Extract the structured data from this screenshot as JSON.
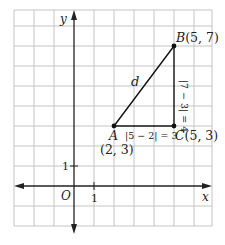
{
  "diagram": {
    "type": "coordinate-plane-distance",
    "grid": {
      "x_min": -3,
      "x_max": 6.9,
      "y_min": -2,
      "y_max": 8.8,
      "unit_px": 20,
      "origin_px": [
        74,
        186
      ],
      "left_px": 14,
      "right_px": 212,
      "top_px": 10,
      "bottom_px": 226,
      "grid_color": "#b5b5b5",
      "axis_color": "#222222"
    },
    "axes": {
      "x_label": "x",
      "y_label": "y",
      "origin_label": "O",
      "x_tick_label": "1",
      "y_tick_label": "1"
    },
    "points": [
      {
        "id": "A",
        "name": "A",
        "coords": "(2, 3)",
        "x": 2,
        "y": 3
      },
      {
        "id": "B",
        "name": "B",
        "coords": "(5, 7)",
        "x": 5,
        "y": 7
      },
      {
        "id": "C",
        "name": "C",
        "coords": "(5, 3)",
        "x": 5,
        "y": 3
      }
    ],
    "labels": {
      "A_name": "A",
      "A_coords": "(2, 3)",
      "B_label": "B(5, 7)",
      "C_label": "C(5, 3)",
      "hypotenuse": "d",
      "horizontal_leg": "|5 − 2| = 3",
      "vertical_leg": "|7 − 3| = 4"
    },
    "segments": [
      {
        "from": "A",
        "to": "B",
        "label": "d"
      },
      {
        "from": "A",
        "to": "C",
        "label": "|5 − 2| = 3"
      },
      {
        "from": "C",
        "to": "B",
        "label": "|7 − 3| = 4"
      }
    ]
  }
}
